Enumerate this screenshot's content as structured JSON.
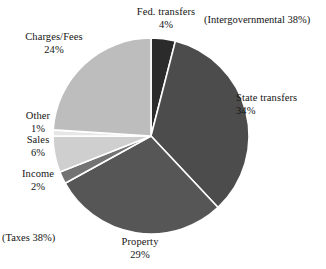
{
  "chart_data": {
    "type": "pie",
    "title": "",
    "categories": [
      "Fed. transfers",
      "State transfers",
      "Property",
      "Income",
      "Sales",
      "Other",
      "Charges/Fees"
    ],
    "values": [
      4,
      34,
      29,
      2,
      6,
      1,
      24
    ],
    "value_labels": [
      "4%",
      "34%",
      "29%",
      "2%",
      "6%",
      "1%",
      "24%"
    ],
    "colors": [
      "#2b2b2b",
      "#4c4c4c",
      "#565656",
      "#737373",
      "#cfcfcf",
      "#e6e6e6",
      "#bdbdbd"
    ],
    "slice_separator_color": "#ffffff",
    "start_angle_deg": 0,
    "direction": "clockwise",
    "legend": "none",
    "grid": false,
    "annotations": [
      "(Intergovernmental 38%)",
      "(Taxes 38%)"
    ],
    "slices": [
      {
        "label": "Fed. transfers",
        "value": 4,
        "value_label": "4%",
        "color": "#2b2b2b"
      },
      {
        "label": "State transfers",
        "value": 34,
        "value_label": "34%",
        "color": "#4c4c4c"
      },
      {
        "label": "Property",
        "value": 29,
        "value_label": "29%",
        "color": "#565656"
      },
      {
        "label": "Income",
        "value": 2,
        "value_label": "2%",
        "color": "#737373"
      },
      {
        "label": "Sales",
        "value": 6,
        "value_label": "6%",
        "color": "#cfcfcf"
      },
      {
        "label": "Other",
        "value": 1,
        "value_label": "1%",
        "color": "#e6e6e6"
      },
      {
        "label": "Charges/Fees",
        "value": 24,
        "value_label": "24%",
        "color": "#bdbdbd"
      }
    ],
    "groups": [
      {
        "label": "(Intergovernmental 38%)",
        "members": [
          "Fed. transfers",
          "State transfers"
        ],
        "total": 38
      },
      {
        "label": "(Taxes 38%)",
        "members": [
          "Property",
          "Income",
          "Sales",
          "Other"
        ],
        "total": 38
      }
    ]
  },
  "labels": {
    "fed_transfers": {
      "name": "Fed. transfers",
      "pct": "4%"
    },
    "state_transfers": {
      "name": "State transfers",
      "pct": "34%"
    },
    "charges_fees": {
      "name": "Charges/Fees",
      "pct": "24%"
    },
    "other": {
      "name": "Other",
      "pct": "1%"
    },
    "sales": {
      "name": "Sales",
      "pct": "6%"
    },
    "income": {
      "name": "Income",
      "pct": "2%"
    },
    "property": {
      "name": "Property",
      "pct": "29%"
    },
    "intergovernmental_group": "(Intergovernmental 38%)",
    "taxes_group": "(Taxes 38%)"
  }
}
